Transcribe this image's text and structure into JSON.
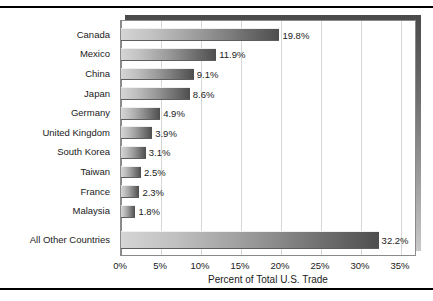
{
  "chart_data": {
    "type": "bar",
    "orientation": "horizontal",
    "title": "",
    "xlabel": "Percent of Total U.S. Trade",
    "ylabel": "",
    "categories": [
      "Canada",
      "Mexico",
      "China",
      "Japan",
      "Germany",
      "United Kingdom",
      "South Korea",
      "Taiwan",
      "France",
      "Malaysia",
      "All Other Countries"
    ],
    "values": [
      19.8,
      11.9,
      9.1,
      8.6,
      4.9,
      3.9,
      3.1,
      2.5,
      2.3,
      1.8,
      32.2
    ],
    "value_labels": [
      "19.8%",
      "11.9%",
      "9.1%",
      "8.6%",
      "4.9%",
      "3.9%",
      "3.1%",
      "2.5%",
      "2.3%",
      "1.8%",
      "32.2%"
    ],
    "xlim": [
      0,
      37
    ],
    "xticks": [
      0,
      5,
      10,
      15,
      20,
      25,
      30,
      35
    ],
    "xtick_labels": [
      "0%",
      "5%",
      "10%",
      "15%",
      "20%",
      "25%",
      "30%",
      "35%"
    ],
    "grid": "vertical",
    "legend": "none",
    "colors": {
      "bar_gradient_light": "#d5d5d5",
      "bar_gradient_dark": "#4e4e4e",
      "gridline": "#d7d7d7",
      "axis": "#8a8a8a",
      "text": "#1a1a1a",
      "frame_rule": "#000000",
      "plot_shadow_dark": "#4a4a4a",
      "plot_shadow_light": "#c9c9c9"
    }
  }
}
